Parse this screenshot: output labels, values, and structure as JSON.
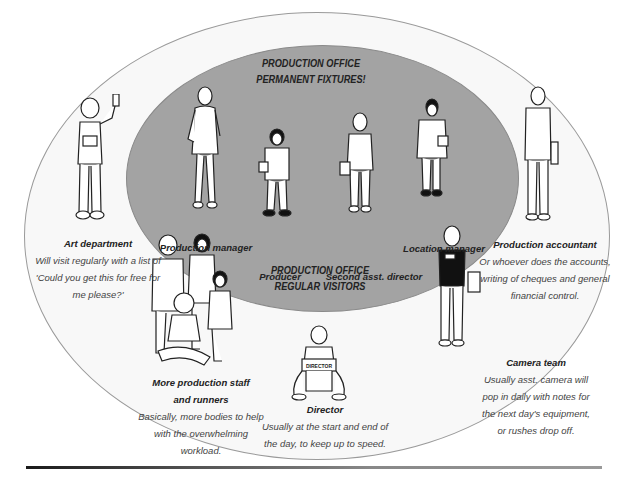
{
  "diagram": {
    "inner_heading": [
      "PRODUCTION OFFICE",
      "PERMANENT FIXTURES!"
    ],
    "outer_heading": [
      "PRODUCTION OFFICE",
      "REGULAR VISITORS"
    ],
    "permanent_fixtures": [
      {
        "role": "Production manager"
      },
      {
        "role": "Producer"
      },
      {
        "role": "Second asst. director"
      },
      {
        "role": "Location manager"
      }
    ],
    "regular_visitors": [
      {
        "role": "Art department",
        "description": [
          "Will visit regularly with a list of",
          "'Could you get this for free for",
          "me please?'"
        ]
      },
      {
        "role": "Production accountant",
        "description": [
          "Or whoever does the accounts,",
          "writing of cheques and general",
          "financial control."
        ]
      },
      {
        "role": "Camera team",
        "description": [
          "Usually asst. camera will",
          "pop in daily with notes for",
          "the next day's equipment,",
          "or rushes drop off."
        ]
      },
      {
        "role": "More production staff and runners",
        "role_lines": [
          "More production staff",
          "and runners"
        ],
        "description": [
          "Basically, more bodies to help",
          "with the overwhelming",
          "workload."
        ]
      },
      {
        "role": "Director",
        "description": [
          "Usually at the start and end of",
          "the day, to keep up to speed."
        ],
        "chair_text": "DIRECTOR"
      }
    ],
    "colors": {
      "inner_fill": "#a3a3a3",
      "outer_fill": "#f8f8f8",
      "line": "#9a9a9a",
      "text": "#222222"
    }
  }
}
